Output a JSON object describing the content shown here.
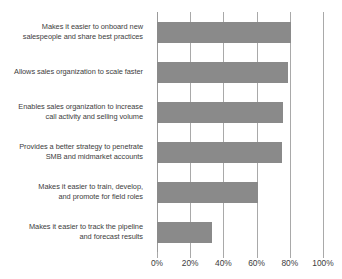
{
  "chart_data": {
    "type": "bar",
    "orientation": "horizontal",
    "title": "",
    "subtitle": "",
    "xlabel": "",
    "ylabel": "",
    "xlim": [
      0,
      100
    ],
    "grid": true,
    "legend": false,
    "legend_position": "none",
    "tick_labels": [
      "0%",
      "20%",
      "40%",
      "60%",
      "80%",
      "100%"
    ],
    "tick_values": [
      0,
      20,
      40,
      60,
      80,
      100
    ],
    "bar_color": "#8a8a8a",
    "grid_color": "#a9a9a9",
    "text_color": "#3d3d3d",
    "categories": [
      "Makes it easier to onboard new salespeople and share best practices",
      "Allows sales organization to scale faster",
      "Enables sales organization to increase call activity and selling volume",
      "Provides a better strategy to penetrate SMB and midmarket accounts",
      "Makes it easier to train, develop, and promote for field roles",
      "Makes it easier to track the pipeline and forecast results"
    ],
    "category_lines": [
      [
        "Makes it easier to onboard new",
        "salespeople and share best practices"
      ],
      [
        "Allows sales organization to scale faster"
      ],
      [
        "Enables sales organization to increase",
        "call activity and selling volume"
      ],
      [
        "Provides a better strategy to penetrate",
        "SMB and midmarket accounts"
      ],
      [
        "Makes it easier to train, develop,",
        "and promote for field roles"
      ],
      [
        "Makes it easier to track the pipeline",
        "and forecast results"
      ]
    ],
    "values": [
      81,
      79,
      76,
      75,
      61,
      33
    ]
  }
}
